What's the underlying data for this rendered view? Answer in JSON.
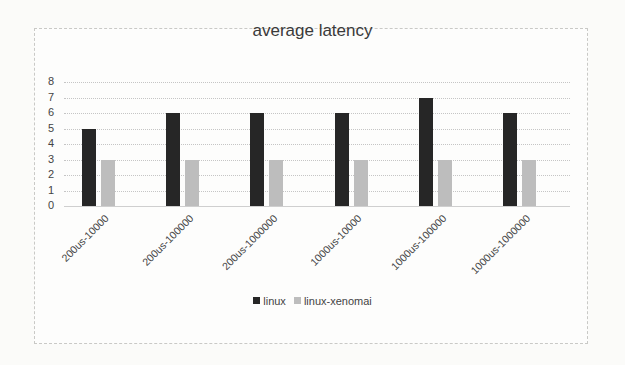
{
  "chart_data": {
    "type": "bar",
    "title": "average latency",
    "xlabel": "",
    "ylabel": "",
    "ylim": [
      0,
      8
    ],
    "yticks": [
      0,
      1,
      2,
      3,
      4,
      5,
      6,
      7,
      8
    ],
    "grid": true,
    "legend_position": "bottom",
    "categories": [
      "200us-10000",
      "200us-100000",
      "200us-1000000",
      "1000us-10000",
      "1000us-100000",
      "1000us-1000000"
    ],
    "series": [
      {
        "name": "linux",
        "color": "#262626",
        "values": [
          5,
          6,
          6,
          6,
          7,
          6
        ]
      },
      {
        "name": "linux-xenomai",
        "color": "#bdbdbd",
        "values": [
          3,
          3,
          3,
          3,
          3,
          3
        ]
      }
    ]
  }
}
